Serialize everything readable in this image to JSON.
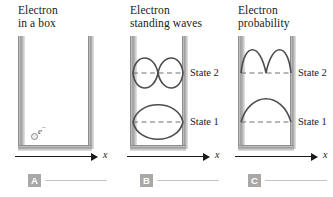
{
  "figure": {
    "panels": [
      {
        "badge": "A",
        "title": "Electron\nin a box",
        "axis_label": "x",
        "electron": {
          "label": "e",
          "charge": "−"
        },
        "states": []
      },
      {
        "badge": "B",
        "title": "Electron\nstanding waves",
        "axis_label": "x",
        "electron": null,
        "states": [
          {
            "name": "State 2",
            "nodes": 1,
            "lobes": 2
          },
          {
            "name": "State 1",
            "nodes": 0,
            "lobes": 1
          }
        ]
      },
      {
        "badge": "C",
        "title": "Electron\nprobability",
        "axis_label": "x",
        "electron": null,
        "states": [
          {
            "name": "State 2",
            "nodes": 1,
            "lobes": 2
          },
          {
            "name": "State 1",
            "nodes": 0,
            "lobes": 1
          }
        ]
      }
    ],
    "colors": {
      "wall": "#9e9e9e",
      "curve": "#4d4d4d",
      "dash": "#6e6e6e",
      "badge": "#a8a8a8",
      "axis": "#1a1a1a"
    }
  }
}
